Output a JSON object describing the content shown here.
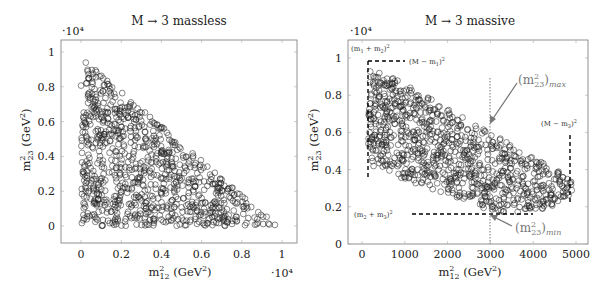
{
  "chart_data": [
    {
      "type": "scatter",
      "title": "M → 3 massless",
      "xlabel": "m²₁₂ (GeV²)",
      "ylabel": "m²₂₃ (GeV²)",
      "x_scale_label": "·10⁴",
      "y_scale_label": "·10⁴",
      "xlim": [
        -0.1,
        1.08
      ],
      "ylim": [
        -0.1,
        1.05
      ],
      "xticks": [
        "0",
        "0.2",
        "0.4",
        "0.6",
        "0.8",
        "1"
      ],
      "yticks": [
        "0",
        "0.2",
        "0.4",
        "0.6",
        "0.8",
        "1"
      ],
      "grid": false,
      "marker": "open circle",
      "region": "triangle: x>=0, y>=0, x+y<=1 (units of 10^4 GeV^2)",
      "series": [
        {
          "name": "events",
          "n_points_approx": 900,
          "x_range": [
            0,
            0.98
          ],
          "y_range": [
            0,
            0.97
          ]
        }
      ]
    },
    {
      "type": "scatter",
      "title": "M → 3 massive",
      "xlabel": "m²₁₂ (GeV²)",
      "ylabel": "m²₂₃ (GeV²)",
      "y_scale_label": "·10⁴",
      "xlim": [
        -300,
        5400
      ],
      "ylim": [
        0,
        1.07
      ],
      "xticks": [
        "0",
        "1000",
        "2000",
        "3000",
        "4000",
        "5000"
      ],
      "yticks": [
        "0",
        "0.2",
        "0.4",
        "0.6",
        "0.8",
        "1"
      ],
      "grid": false,
      "marker": "open circle",
      "series": [
        {
          "name": "events",
          "n_points_approx": 900,
          "x_range": [
            150,
            4900
          ],
          "y_range": [
            0.17,
            0.97
          ]
        }
      ],
      "annotations": [
        {
          "text": "(m₁ + m₂)²",
          "x": 150,
          "y": 1.02
        },
        {
          "text": "(M − m₁)²",
          "y": 0.98,
          "dashed_line": "horizontal from x=150 to x=1100"
        },
        {
          "text": "(M − m₃)²",
          "x": 4900,
          "dashed_line": "vertical from y=0.2 to y=0.5"
        },
        {
          "text": "(m₂ + m₃)²",
          "y": 0.165,
          "dashed_line": "horizontal from x=1400 to x=4000"
        },
        {
          "text": "(m²₂₃)max",
          "arrow_to": [
            3000,
            0.66
          ]
        },
        {
          "text": "(m²₂₃)min",
          "arrow_to": [
            3000,
            0.17
          ]
        },
        {
          "dotted_line": "vertical at x=3000 from y=0 to y=0.91"
        },
        {
          "dashed_line": "vertical at x=150 from y=0.4 to y=0.98"
        }
      ]
    }
  ]
}
